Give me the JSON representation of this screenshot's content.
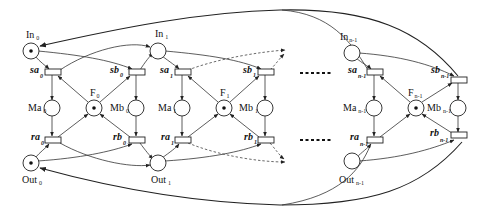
{
  "diagram": {
    "type": "petri-net",
    "ellipsis_top": "......",
    "ellipsis_bottom": "......",
    "places": [
      {
        "id": "In0",
        "label": "In",
        "sub": "0",
        "token": true
      },
      {
        "id": "In1",
        "label": "In",
        "sub": "1",
        "token": false
      },
      {
        "id": "Inn1",
        "label": "In",
        "sub": "n-1",
        "token": false
      },
      {
        "id": "Ma0",
        "label": "Ma",
        "sub": "0",
        "token": false
      },
      {
        "id": "F0",
        "label": "F",
        "sub": "0",
        "token": true
      },
      {
        "id": "Mb0",
        "label": "Mb",
        "sub": "0",
        "token": false
      },
      {
        "id": "Ma1",
        "label": "Ma",
        "sub": "1",
        "token": false
      },
      {
        "id": "F1",
        "label": "F",
        "sub": "1",
        "token": true
      },
      {
        "id": "Mb1",
        "label": "Mb",
        "sub": "1",
        "token": false
      },
      {
        "id": "Man1",
        "label": "Ma",
        "sub": "n-1",
        "token": false
      },
      {
        "id": "Fn1",
        "label": "F",
        "sub": "n-1",
        "token": true
      },
      {
        "id": "Mbn1",
        "label": "Mb",
        "sub": "n-1",
        "token": false
      },
      {
        "id": "Out0",
        "label": "Out",
        "sub": "0",
        "token": true
      },
      {
        "id": "Out1",
        "label": "Out",
        "sub": "1",
        "token": false
      },
      {
        "id": "Outn1",
        "label": "Out",
        "sub": "n-1",
        "token": false
      }
    ],
    "transitions": [
      {
        "id": "sa0",
        "label": "sa",
        "sub": "0"
      },
      {
        "id": "sb0",
        "label": "sb",
        "sub": "0"
      },
      {
        "id": "ra0",
        "label": "ra",
        "sub": "0"
      },
      {
        "id": "rb0",
        "label": "rb",
        "sub": "0"
      },
      {
        "id": "sa1",
        "label": "sa",
        "sub": "1"
      },
      {
        "id": "sb1",
        "label": "sb",
        "sub": "1"
      },
      {
        "id": "ra1",
        "label": "ra",
        "sub": "1"
      },
      {
        "id": "rb1",
        "label": "rb",
        "sub": "1"
      },
      {
        "id": "san1",
        "label": "sa",
        "sub": "n-1"
      },
      {
        "id": "sbn1",
        "label": "sb",
        "sub": "n-1"
      },
      {
        "id": "ran1",
        "label": "ra",
        "sub": "n-1"
      },
      {
        "id": "rbn1",
        "label": "rb",
        "sub": "n-1"
      }
    ]
  }
}
